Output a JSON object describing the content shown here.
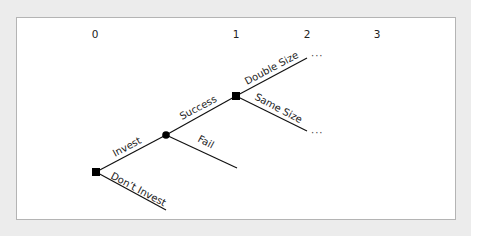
{
  "diagram": {
    "type": "decision-tree",
    "time_labels": [
      "0",
      "1",
      "2",
      "3"
    ],
    "nodes": {
      "root": {
        "kind": "decision",
        "shape": "square"
      },
      "chance": {
        "kind": "chance",
        "shape": "circle"
      },
      "second": {
        "kind": "decision",
        "shape": "square"
      }
    },
    "branches": {
      "invest": "Invest",
      "dont_invest": "Don’t Invest",
      "success": "Success",
      "fail": "Fail",
      "double_size": "Double Size",
      "same_size": "Same Size"
    },
    "continuation": "···",
    "colors": {
      "background": "#ececec",
      "panel": "#ffffff",
      "border": "#b4b4b4",
      "line": "#111111"
    }
  }
}
